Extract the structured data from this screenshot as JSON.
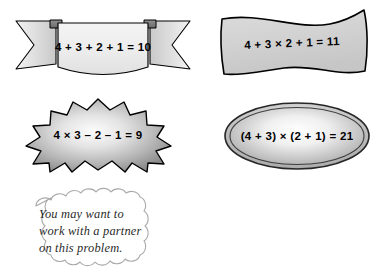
{
  "page": {
    "background_color": "#ffffff"
  },
  "shapes": [
    {
      "id": "banner",
      "kind": "ribbon-banner",
      "equation": "4 + 3 + 2 + 1 = 10",
      "fill_color": "#ededed",
      "tail_fill_color": "#d8d8d8",
      "stroke_color": "#000000"
    },
    {
      "id": "wave",
      "kind": "wavy-flag-banner",
      "equation": "4 + 3 × 2 + 1 = 11",
      "fill_color": "#d2d2d2",
      "stroke_color": "#000000"
    },
    {
      "id": "star",
      "kind": "starburst",
      "equation": "4 × 3 – 2 – 1 = 9",
      "fill_center_color": "#f6f6f6",
      "fill_edge_color": "#8f8f8f",
      "stroke_color": "#000000",
      "points": 14
    },
    {
      "id": "ellipse",
      "kind": "ellipse-double-ring",
      "equation": "(4 + 3) × (2 + 1) = 21",
      "fill_center_color": "#ffffff",
      "fill_edge_color": "#a3a3a3",
      "stroke_color": "#1a1a1a"
    }
  ],
  "callout": {
    "id": "cloud-note",
    "kind": "cloud-callout",
    "fill_color": "#ffffff",
    "stroke_color": "#a9a9a9",
    "lines": [
      "You may want to",
      "work with a partner",
      "on this problem."
    ]
  }
}
